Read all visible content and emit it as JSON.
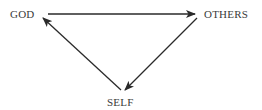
{
  "diagram": {
    "type": "triangle-cycle",
    "nodes": [
      {
        "id": "god",
        "label": "GOD",
        "x": 10,
        "y": 9
      },
      {
        "id": "others",
        "label": "OTHERS",
        "x": 204,
        "y": 9
      },
      {
        "id": "self",
        "label": "SELF",
        "x": 107,
        "y": 97
      }
    ],
    "edges": [
      {
        "from": "god",
        "to": "others",
        "arrow": "end"
      },
      {
        "from": "others",
        "to": "self",
        "arrow": "end"
      },
      {
        "from": "self",
        "to": "god",
        "arrow": "end"
      }
    ],
    "colors": {
      "line": "#2a2a2a",
      "text": "#3a3a3a",
      "background": "#ffffff"
    }
  }
}
